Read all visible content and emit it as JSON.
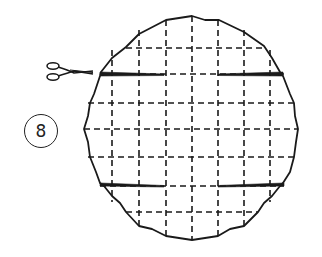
{
  "diagram": {
    "step_number": "8",
    "icons": [
      "scissors-icon"
    ],
    "colors": {
      "line": "#1a1a1a",
      "background": "#ffffff"
    }
  }
}
